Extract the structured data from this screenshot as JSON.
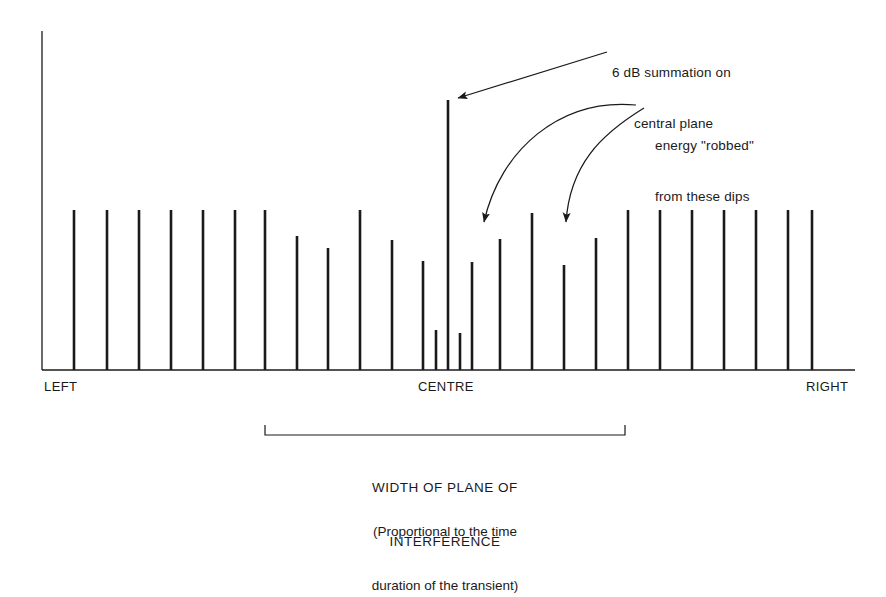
{
  "figure": {
    "background_color": "#ffffff",
    "ink_color": "#1a1a1a"
  },
  "annotations": {
    "summation": {
      "name": "6 dB summation callout",
      "line1": "6 dB summation on",
      "line2": "central plane"
    },
    "robbed": {
      "name": "energy robbed callout",
      "line1": "energy \"robbed\"",
      "line2": "from these dips"
    }
  },
  "axis": {
    "left_label": "LEFT",
    "centre_label": "CENTRE",
    "right_label": "RIGHT"
  },
  "caption": {
    "bracket_label_line1": "WIDTH OF PLANE OF",
    "bracket_label_line2": "INTERFERENCE",
    "subcaption_line1": "(Proportional to the time",
    "subcaption_line2": "duration of the transient)"
  },
  "chart_data": {
    "type": "bar",
    "xlabel": "",
    "ylabel": "",
    "grid": false,
    "legend": null,
    "axis_ranges": {
      "x_pixels": [
        42,
        855
      ],
      "y_pixels": [
        31,
        370
      ]
    },
    "categories": [
      "b1",
      "b2",
      "b3",
      "b4",
      "b5",
      "b6",
      "b7",
      "b8",
      "b9",
      "b10",
      "b11",
      "b12",
      "b13",
      "centre",
      "b15",
      "b16",
      "b17",
      "b18",
      "b19",
      "b20",
      "b21",
      "b22",
      "b23",
      "b24",
      "b25"
    ],
    "tick_x": [
      74,
      107,
      139,
      171,
      203,
      235,
      265,
      297,
      328,
      360,
      392,
      423,
      436,
      448,
      460,
      472,
      500,
      532,
      564,
      596,
      628,
      660,
      692,
      724,
      756,
      812
    ],
    "bars": [
      {
        "id": "b1",
        "x": 74,
        "top_y": 210,
        "height": 160,
        "kind": "full"
      },
      {
        "id": "b2",
        "x": 107,
        "top_y": 210,
        "height": 160,
        "kind": "full"
      },
      {
        "id": "b3",
        "x": 139,
        "top_y": 210,
        "height": 160,
        "kind": "full"
      },
      {
        "id": "b4",
        "x": 171,
        "top_y": 210,
        "height": 160,
        "kind": "full"
      },
      {
        "id": "b5",
        "x": 203,
        "top_y": 210,
        "height": 160,
        "kind": "full"
      },
      {
        "id": "b6",
        "x": 235,
        "top_y": 210,
        "height": 160,
        "kind": "full"
      },
      {
        "id": "b7",
        "x": 265,
        "top_y": 210,
        "height": 160,
        "kind": "full"
      },
      {
        "id": "b8",
        "x": 297,
        "top_y": 236,
        "height": 134,
        "kind": "dip"
      },
      {
        "id": "b9",
        "x": 328,
        "top_y": 248,
        "height": 122,
        "kind": "dip"
      },
      {
        "id": "b10",
        "x": 360,
        "top_y": 210,
        "height": 160,
        "kind": "full"
      },
      {
        "id": "b11",
        "x": 392,
        "top_y": 240,
        "height": 130,
        "kind": "dip"
      },
      {
        "id": "b12",
        "x": 423,
        "top_y": 261,
        "height": 109,
        "kind": "dip"
      },
      {
        "id": "b13",
        "x": 436,
        "top_y": 330,
        "height": 40,
        "kind": "deep-dip"
      },
      {
        "id": "centre",
        "x": 448,
        "top_y": 100,
        "height": 270,
        "kind": "peak"
      },
      {
        "id": "b15",
        "x": 460,
        "top_y": 333,
        "height": 37,
        "kind": "deep-dip"
      },
      {
        "id": "b16",
        "x": 472,
        "top_y": 262,
        "height": 108,
        "kind": "dip"
      },
      {
        "id": "b17",
        "x": 500,
        "top_y": 239,
        "height": 131,
        "kind": "dip"
      },
      {
        "id": "b18",
        "x": 532,
        "top_y": 213,
        "height": 157,
        "kind": "full"
      },
      {
        "id": "b19",
        "x": 564,
        "top_y": 265,
        "height": 105,
        "kind": "dip"
      },
      {
        "id": "b20",
        "x": 596,
        "top_y": 238,
        "height": 132,
        "kind": "dip"
      },
      {
        "id": "b21",
        "x": 628,
        "top_y": 210,
        "height": 160,
        "kind": "full"
      },
      {
        "id": "b22",
        "x": 660,
        "top_y": 210,
        "height": 160,
        "kind": "full"
      },
      {
        "id": "b23",
        "x": 692,
        "top_y": 210,
        "height": 160,
        "kind": "full"
      },
      {
        "id": "b24",
        "x": 724,
        "top_y": 210,
        "height": 160,
        "kind": "full"
      },
      {
        "id": "b25",
        "x": 756,
        "top_y": 210,
        "height": 160,
        "kind": "full"
      },
      {
        "id": "b26",
        "x": 788,
        "top_y": 210,
        "height": 160,
        "kind": "full"
      },
      {
        "id": "b27",
        "x": 812,
        "top_y": 210,
        "height": 160,
        "kind": "full"
      }
    ],
    "notes": [
      "Impulse comb: uniform amplitude outside plane of interference",
      "Central bar shows +6 dB summation",
      "Flanking bars show energy deficits (dips)"
    ]
  },
  "geometry": {
    "axis_x": 42,
    "baseline_y": 370,
    "axis_top_y": 31,
    "baseline_right_x": 855,
    "bar_width": 2.6,
    "bracket": {
      "left_x": 265,
      "right_x": 625,
      "top_y": 425,
      "line_y": 435
    }
  }
}
